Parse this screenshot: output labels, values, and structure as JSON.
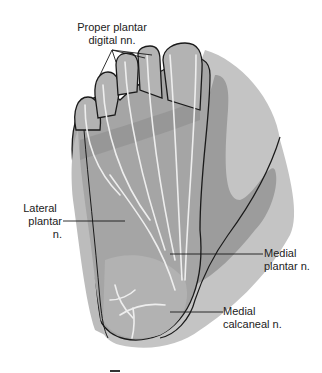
{
  "diagram": {
    "labels": [
      {
        "id": "proper-plantar-digital",
        "line1": "Proper plantar",
        "line2": "digital nn."
      },
      {
        "id": "lateral-plantar",
        "line1": "Lateral",
        "line2": "plantar n."
      },
      {
        "id": "medial-plantar",
        "line1": "Medial",
        "line2": "plantar n."
      },
      {
        "id": "medial-calcaneal",
        "line1": "Medial",
        "line2": "calcaneal n."
      }
    ],
    "colors": {
      "background": "#ffffff",
      "outer_region": "#b9b9b9",
      "mid_region": "#9a9a9a",
      "dark_region": "#858585",
      "nerve": "#eeeeee",
      "outline": "#1a1a1a",
      "text": "#222222"
    }
  }
}
